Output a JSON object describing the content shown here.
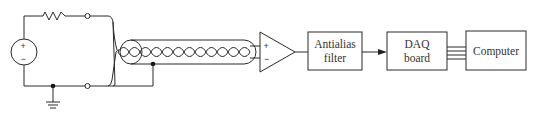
{
  "diagram": {
    "type": "signal-acquisition-block-diagram",
    "source": {
      "plus_label": "+",
      "minus_label": "−"
    },
    "amplifier": {
      "plus_label": "+",
      "minus_label": "−"
    },
    "blocks": [
      {
        "id": "antialias",
        "line1": "Antialias",
        "line2": "filter"
      },
      {
        "id": "daq",
        "line1": "DAQ",
        "line2": "board"
      },
      {
        "id": "computer",
        "line1": "Computer"
      }
    ],
    "connections": [
      {
        "from": "voltage-source",
        "to": "resistor"
      },
      {
        "from": "resistor",
        "to": "terminal-top"
      },
      {
        "from": "terminal-top",
        "to": "twisted-pair-cable"
      },
      {
        "from": "terminal-bottom",
        "to": "twisted-pair-cable"
      },
      {
        "from": "twisted-pair-cable",
        "to": "amplifier"
      },
      {
        "from": "amplifier",
        "to": "antialias"
      },
      {
        "from": "antialias",
        "to": "daq",
        "arrow": true
      },
      {
        "from": "daq",
        "to": "computer",
        "bus_lines": 4
      }
    ]
  }
}
